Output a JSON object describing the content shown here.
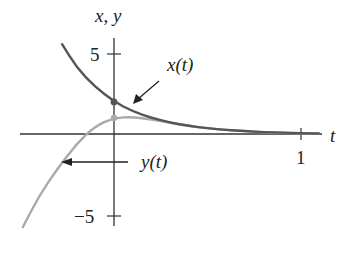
{
  "chart_data": {
    "type": "line",
    "title": "",
    "xlabel": "t",
    "ylabel": "x, y",
    "xlim": [
      -0.49,
      1.1
    ],
    "ylim": [
      -6,
      6
    ],
    "x_ticks": [
      {
        "value": 1,
        "label": "1"
      }
    ],
    "y_ticks": [
      {
        "value": 5,
        "label": "5"
      },
      {
        "value": -5,
        "label": "−5"
      }
    ],
    "grid": false,
    "legend": null,
    "series": [
      {
        "name": "x(t)",
        "color": "#555555",
        "x": [
          -0.28,
          -0.2,
          -0.1,
          0,
          0.1,
          0.2,
          0.3,
          0.4,
          0.5,
          0.6,
          0.7,
          0.8,
          0.9,
          1.0,
          1.1
        ],
        "y": [
          5.6,
          4.1,
          2.9,
          2.0,
          1.4,
          1.0,
          0.7,
          0.5,
          0.35,
          0.25,
          0.18,
          0.12,
          0.08,
          0.05,
          0.03
        ]
      },
      {
        "name": "y(t)",
        "color": "#aaaaaa",
        "x": [
          -0.49,
          -0.4,
          -0.3,
          -0.2,
          -0.1,
          0,
          0.1,
          0.2,
          0.3,
          0.4,
          0.5,
          0.6,
          0.7,
          0.8,
          0.9,
          1.0,
          1.1
        ],
        "y": [
          -5.8,
          -3.8,
          -2.1,
          -0.6,
          0.5,
          1.0,
          1.05,
          0.9,
          0.7,
          0.5,
          0.35,
          0.25,
          0.17,
          0.11,
          0.07,
          0.04,
          0.02
        ]
      }
    ],
    "markers": [
      {
        "series": "x(t)",
        "x": 0,
        "y": 2.0
      },
      {
        "series": "y(t)",
        "x": 0,
        "y": 1.0
      }
    ],
    "annotations": [
      {
        "text": "x(t)",
        "arrow_to": {
          "x": 0.06,
          "y": 1.6
        }
      },
      {
        "text": "y(t)",
        "arrow_to": {
          "x": -0.29,
          "y": -1.8
        }
      }
    ]
  },
  "labels": {
    "axis_y": "x, y",
    "axis_x": "t",
    "tick_5": "5",
    "tick_neg5": "−5",
    "tick_1": "1",
    "annot_x": "x(t)",
    "annot_y": "y(t)"
  }
}
